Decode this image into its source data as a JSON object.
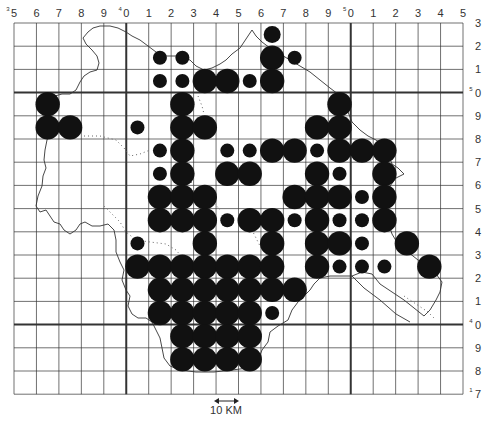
{
  "map": {
    "type": "distribution grid map",
    "column_labels": [
      "5",
      "6",
      "7",
      "8",
      "9",
      "0",
      "1",
      "2",
      "3",
      "4",
      "5",
      "6",
      "7",
      "8",
      "9",
      "0",
      "1",
      "2",
      "3",
      "4",
      "5"
    ],
    "column_label_prefixes": {
      "0": "3",
      "5": "4",
      "15": "5"
    },
    "row_labels": [
      "3",
      "2",
      "1",
      "0",
      "9",
      "8",
      "7",
      "6",
      "5",
      "4",
      "3",
      "2",
      "1",
      "0",
      "9",
      "8",
      "7"
    ],
    "row_label_prefixes": {
      "3": "5",
      "13": "4",
      "16": "1"
    },
    "scale_label": "10 KM",
    "dot_color": "#111111",
    "records": [
      {
        "col": 11,
        "row": 0,
        "size": "medium"
      },
      {
        "col": 6,
        "row": 1,
        "size": "small"
      },
      {
        "col": 7,
        "row": 1,
        "size": "small"
      },
      {
        "col": 11,
        "row": 1,
        "size": "large"
      },
      {
        "col": 12,
        "row": 1,
        "size": "small"
      },
      {
        "col": 6,
        "row": 2,
        "size": "small"
      },
      {
        "col": 7,
        "row": 2,
        "size": "small"
      },
      {
        "col": 8,
        "row": 2,
        "size": "large"
      },
      {
        "col": 9,
        "row": 2,
        "size": "large"
      },
      {
        "col": 10,
        "row": 2,
        "size": "small"
      },
      {
        "col": 11,
        "row": 2,
        "size": "large"
      },
      {
        "col": 1,
        "row": 3,
        "size": "large"
      },
      {
        "col": 7,
        "row": 3,
        "size": "large"
      },
      {
        "col": 14,
        "row": 3,
        "size": "large"
      },
      {
        "col": 1,
        "row": 4,
        "size": "large"
      },
      {
        "col": 2,
        "row": 4,
        "size": "large"
      },
      {
        "col": 5,
        "row": 4,
        "size": "small"
      },
      {
        "col": 7,
        "row": 4,
        "size": "large"
      },
      {
        "col": 8,
        "row": 4,
        "size": "large"
      },
      {
        "col": 13,
        "row": 4,
        "size": "large"
      },
      {
        "col": 14,
        "row": 4,
        "size": "large"
      },
      {
        "col": 6,
        "row": 5,
        "size": "small"
      },
      {
        "col": 7,
        "row": 5,
        "size": "large"
      },
      {
        "col": 9,
        "row": 5,
        "size": "small"
      },
      {
        "col": 10,
        "row": 5,
        "size": "small"
      },
      {
        "col": 11,
        "row": 5,
        "size": "large"
      },
      {
        "col": 12,
        "row": 5,
        "size": "large"
      },
      {
        "col": 13,
        "row": 5,
        "size": "small"
      },
      {
        "col": 14,
        "row": 5,
        "size": "large"
      },
      {
        "col": 15,
        "row": 5,
        "size": "large"
      },
      {
        "col": 16,
        "row": 5,
        "size": "large"
      },
      {
        "col": 6,
        "row": 6,
        "size": "small"
      },
      {
        "col": 7,
        "row": 6,
        "size": "large"
      },
      {
        "col": 9,
        "row": 6,
        "size": "large"
      },
      {
        "col": 10,
        "row": 6,
        "size": "large"
      },
      {
        "col": 13,
        "row": 6,
        "size": "large"
      },
      {
        "col": 14,
        "row": 6,
        "size": "small"
      },
      {
        "col": 16,
        "row": 6,
        "size": "large"
      },
      {
        "col": 6,
        "row": 7,
        "size": "large"
      },
      {
        "col": 7,
        "row": 7,
        "size": "large"
      },
      {
        "col": 8,
        "row": 7,
        "size": "large"
      },
      {
        "col": 12,
        "row": 7,
        "size": "large"
      },
      {
        "col": 13,
        "row": 7,
        "size": "large"
      },
      {
        "col": 14,
        "row": 7,
        "size": "large"
      },
      {
        "col": 15,
        "row": 7,
        "size": "small"
      },
      {
        "col": 16,
        "row": 7,
        "size": "large"
      },
      {
        "col": 6,
        "row": 8,
        "size": "large"
      },
      {
        "col": 7,
        "row": 8,
        "size": "large"
      },
      {
        "col": 8,
        "row": 8,
        "size": "large"
      },
      {
        "col": 9,
        "row": 8,
        "size": "small"
      },
      {
        "col": 10,
        "row": 8,
        "size": "large"
      },
      {
        "col": 11,
        "row": 8,
        "size": "large"
      },
      {
        "col": 12,
        "row": 8,
        "size": "small"
      },
      {
        "col": 13,
        "row": 8,
        "size": "large"
      },
      {
        "col": 14,
        "row": 8,
        "size": "small"
      },
      {
        "col": 15,
        "row": 8,
        "size": "small"
      },
      {
        "col": 16,
        "row": 8,
        "size": "large"
      },
      {
        "col": 5,
        "row": 9,
        "size": "small"
      },
      {
        "col": 8,
        "row": 9,
        "size": "large"
      },
      {
        "col": 11,
        "row": 9,
        "size": "large"
      },
      {
        "col": 13,
        "row": 9,
        "size": "large"
      },
      {
        "col": 14,
        "row": 9,
        "size": "large"
      },
      {
        "col": 15,
        "row": 9,
        "size": "small"
      },
      {
        "col": 17,
        "row": 9,
        "size": "large"
      },
      {
        "col": 5,
        "row": 10,
        "size": "large"
      },
      {
        "col": 6,
        "row": 10,
        "size": "large"
      },
      {
        "col": 7,
        "row": 10,
        "size": "large"
      },
      {
        "col": 8,
        "row": 10,
        "size": "large"
      },
      {
        "col": 9,
        "row": 10,
        "size": "large"
      },
      {
        "col": 10,
        "row": 10,
        "size": "large"
      },
      {
        "col": 11,
        "row": 10,
        "size": "large"
      },
      {
        "col": 13,
        "row": 10,
        "size": "large"
      },
      {
        "col": 14,
        "row": 10,
        "size": "small"
      },
      {
        "col": 15,
        "row": 10,
        "size": "small"
      },
      {
        "col": 16,
        "row": 10,
        "size": "small"
      },
      {
        "col": 18,
        "row": 10,
        "size": "large"
      },
      {
        "col": 6,
        "row": 11,
        "size": "large"
      },
      {
        "col": 7,
        "row": 11,
        "size": "large"
      },
      {
        "col": 8,
        "row": 11,
        "size": "large"
      },
      {
        "col": 9,
        "row": 11,
        "size": "large"
      },
      {
        "col": 10,
        "row": 11,
        "size": "large"
      },
      {
        "col": 11,
        "row": 11,
        "size": "large"
      },
      {
        "col": 12,
        "row": 11,
        "size": "large"
      },
      {
        "col": 6,
        "row": 12,
        "size": "large"
      },
      {
        "col": 7,
        "row": 12,
        "size": "large"
      },
      {
        "col": 8,
        "row": 12,
        "size": "large"
      },
      {
        "col": 9,
        "row": 12,
        "size": "large"
      },
      {
        "col": 10,
        "row": 12,
        "size": "large"
      },
      {
        "col": 11,
        "row": 12,
        "size": "small"
      },
      {
        "col": 7,
        "row": 13,
        "size": "large"
      },
      {
        "col": 8,
        "row": 13,
        "size": "large"
      },
      {
        "col": 9,
        "row": 13,
        "size": "large"
      },
      {
        "col": 10,
        "row": 13,
        "size": "large"
      },
      {
        "col": 7,
        "row": 14,
        "size": "large"
      },
      {
        "col": 8,
        "row": 14,
        "size": "large"
      },
      {
        "col": 9,
        "row": 14,
        "size": "large"
      },
      {
        "col": 10,
        "row": 14,
        "size": "large"
      }
    ]
  }
}
